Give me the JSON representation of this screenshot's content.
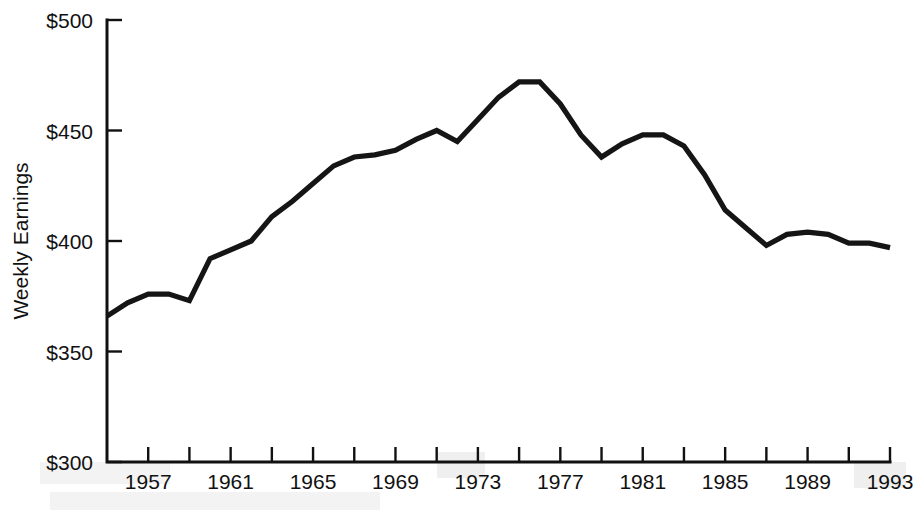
{
  "chart_data": {
    "type": "line",
    "title": "",
    "xlabel": "",
    "ylabel": "Weekly Earnings",
    "xlim": [
      1955,
      1993
    ],
    "ylim": [
      300,
      500
    ],
    "grid": false,
    "legend": false,
    "y_tick_labels": [
      "$300",
      "$350",
      "$400",
      "$450",
      "$500"
    ],
    "y_tick_values": [
      300,
      350,
      400,
      450,
      500
    ],
    "x_tick_labels": [
      "1957",
      "1961",
      "1965",
      "1969",
      "1973",
      "1977",
      "1981",
      "1985",
      "1989",
      "1993"
    ],
    "x_tick_label_values": [
      1957,
      1961,
      1965,
      1969,
      1973,
      1977,
      1981,
      1985,
      1989,
      1993
    ],
    "x_minor_tick_values": [
      1957,
      1959,
      1961,
      1963,
      1965,
      1967,
      1969,
      1971,
      1973,
      1975,
      1977,
      1979,
      1981,
      1983,
      1985,
      1987,
      1989,
      1991,
      1993
    ],
    "series": [
      {
        "name": "Weekly Earnings",
        "color": "#151515",
        "x": [
          1955,
          1956,
          1957,
          1958,
          1959,
          1960,
          1961,
          1962,
          1963,
          1964,
          1965,
          1966,
          1967,
          1968,
          1969,
          1970,
          1971,
          1972,
          1973,
          1974,
          1975,
          1976,
          1977,
          1978,
          1979,
          1980,
          1981,
          1982,
          1983,
          1984,
          1985,
          1986,
          1987,
          1988,
          1989,
          1990,
          1991,
          1992,
          1993
        ],
        "values": [
          366,
          372,
          376,
          376,
          373,
          392,
          396,
          400,
          411,
          418,
          426,
          434,
          438,
          439,
          441,
          446,
          450,
          445,
          455,
          465,
          472,
          472,
          462,
          448,
          438,
          444,
          448,
          448,
          443,
          430,
          414,
          406,
          398,
          403,
          404,
          403,
          399,
          399,
          397
        ]
      }
    ]
  },
  "axis": {
    "y_label": "Weekly Earnings"
  }
}
